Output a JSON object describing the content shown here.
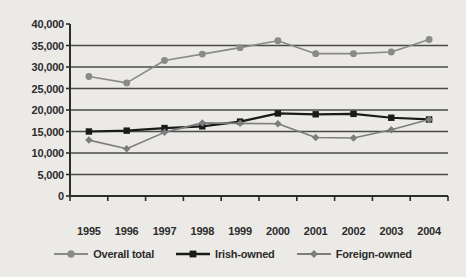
{
  "chart_data": {
    "type": "line",
    "title": "",
    "subtitle": "",
    "xlabel": "",
    "ylabel": "",
    "categories": [
      "1995",
      "1996",
      "1997",
      "1998",
      "1999",
      "2000",
      "2001",
      "2002",
      "2003",
      "2004"
    ],
    "ylim": [
      0,
      40000
    ],
    "ytick_values": [
      0,
      5000,
      10000,
      15000,
      20000,
      25000,
      30000,
      35000,
      40000
    ],
    "ytick_labels": [
      "0",
      "5,000",
      "10,000",
      "15,000",
      "20,000",
      "25,000",
      "30,000",
      "35,000",
      "40,000"
    ],
    "grid": "horizontal",
    "legend_position": "bottom",
    "series": [
      {
        "name": "Overall total",
        "marker": "circle",
        "color": "#8a8a8a",
        "values": [
          27800,
          26300,
          31500,
          33000,
          34500,
          36100,
          33100,
          33100,
          33500,
          36400
        ]
      },
      {
        "name": "Irish-owned",
        "marker": "square",
        "color": "#1a1a1a",
        "values": [
          15000,
          15200,
          15800,
          16200,
          17300,
          19200,
          19000,
          19100,
          18200,
          17800
        ]
      },
      {
        "name": "Foreign-owned",
        "marker": "diamond",
        "color": "#7d7d7d",
        "values": [
          13000,
          11000,
          14800,
          17000,
          16900,
          16800,
          13600,
          13500,
          15400,
          17800
        ]
      }
    ]
  },
  "legend": {
    "items": [
      {
        "label": "Overall total"
      },
      {
        "label": "Irish-owned"
      },
      {
        "label": "Foreign-owned"
      }
    ]
  }
}
